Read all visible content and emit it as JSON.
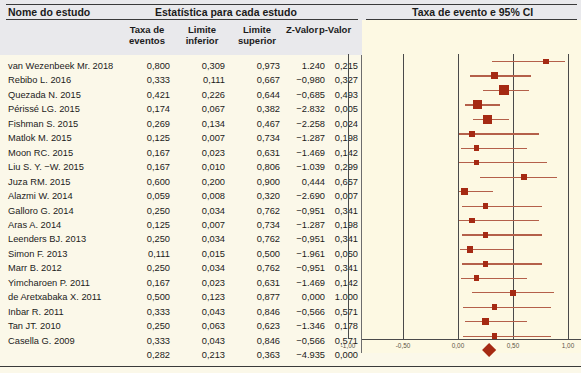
{
  "header": {
    "study_col": "Nome do estudo",
    "stats_group": "Estatística para cada estudo",
    "plot_group": "Taxa de evento e 95% CI",
    "columns": [
      {
        "l1": "Taxa de",
        "l2": "eventos"
      },
      {
        "l1": "Limite",
        "l2": "inferior"
      },
      {
        "l1": "Limite",
        "l2": "superior"
      },
      {
        "l1": "Z-Valor",
        "l2": ""
      },
      {
        "l1": "p-Valor",
        "l2": ""
      }
    ]
  },
  "axis": {
    "ticks": [
      "-1,00",
      "-0,50",
      "0,00",
      "0,50",
      "1,00"
    ],
    "tick_values": [
      -1.0,
      -0.5,
      0.0,
      0.5,
      1.0
    ],
    "min": -1.0,
    "max": 1.0
  },
  "colors": {
    "marker": "#a52a13",
    "ci": "#b4604a",
    "header_band": "#e9e9ec",
    "plot_bg": "#fdf9e3",
    "page_bg": "#fbf8e9"
  },
  "chart_data": {
    "type": "forest",
    "title": "Taxa de evento e 95% CI",
    "xlabel": "",
    "ylabel": "",
    "xlim": [
      -1.0,
      1.0
    ],
    "grid": true,
    "legend": "none",
    "columns": [
      "Nome do estudo",
      "Taxa de eventos",
      "Limite inferior",
      "Limite superior",
      "Z-Valor",
      "p-Valor"
    ],
    "rows": [
      {
        "study": "van Wezenbeek Mr. 2018",
        "rate": "0,800",
        "lower": "0,309",
        "upper": "0,973",
        "z": "1.240",
        "p": "0,215",
        "rate_v": 0.8,
        "lower_v": 0.309,
        "upper_v": 0.973,
        "weight": 0.3
      },
      {
        "study": "Rebibo L. 2016",
        "rate": "0,333",
        "lower": "0,111",
        "upper": "0,667",
        "z": "−0,980",
        "p": "0,327",
        "rate_v": 0.333,
        "lower_v": 0.111,
        "upper_v": 0.667,
        "weight": 0.52
      },
      {
        "study": "Quezada N. 2015",
        "rate": "0,421",
        "lower": "0,226",
        "upper": "0,644",
        "z": "−0,685",
        "p": "0,493",
        "rate_v": 0.421,
        "lower_v": 0.226,
        "upper_v": 0.644,
        "weight": 1.0
      },
      {
        "study": "Périssé LG. 2015",
        "rate": "0,174",
        "lower": "0,067",
        "upper": "0,382",
        "z": "−2.832",
        "p": "0,005",
        "rate_v": 0.174,
        "lower_v": 0.067,
        "upper_v": 0.382,
        "weight": 0.82
      },
      {
        "study": "Fishman S. 2015",
        "rate": "0,269",
        "lower": "0,134",
        "upper": "0,467",
        "z": "−2.258",
        "p": "0,024",
        "rate_v": 0.269,
        "lower_v": 0.134,
        "upper_v": 0.467,
        "weight": 0.86
      },
      {
        "study": "Matlok M. 2015",
        "rate": "0,125",
        "lower": "0,007",
        "upper": "0,734",
        "z": "−1.287",
        "p": "0,198",
        "rate_v": 0.125,
        "lower_v": 0.007,
        "upper_v": 0.734,
        "weight": 0.4
      },
      {
        "study": "Moon RC. 2015",
        "rate": "0,167",
        "lower": "0,023",
        "upper": "0,631",
        "z": "−1.469",
        "p": "0,142",
        "rate_v": 0.167,
        "lower_v": 0.023,
        "upper_v": 0.631,
        "weight": 0.3
      },
      {
        "study": "Liu S. Y. −W. 2015",
        "rate": "0,167",
        "lower": "0,010",
        "upper": "0,806",
        "z": "−1.039",
        "p": "0,299",
        "rate_v": 0.167,
        "lower_v": 0.01,
        "upper_v": 0.806,
        "weight": 0.3
      },
      {
        "study": "Juza RM. 2015",
        "rate": "0,600",
        "lower": "0,200",
        "upper": "0,900",
        "z": "0,444",
        "p": "0,657",
        "rate_v": 0.6,
        "lower_v": 0.2,
        "upper_v": 0.9,
        "weight": 0.34
      },
      {
        "study": "Alazmi W. 2014",
        "rate": "0,059",
        "lower": "0,008",
        "upper": "0,320",
        "z": "−2.690",
        "p": "0,007",
        "rate_v": 0.059,
        "lower_v": 0.008,
        "upper_v": 0.32,
        "weight": 0.4
      },
      {
        "study": "Galloro G. 2014",
        "rate": "0,250",
        "lower": "0,034",
        "upper": "0,762",
        "z": "−0,951",
        "p": "0,341",
        "rate_v": 0.25,
        "lower_v": 0.034,
        "upper_v": 0.762,
        "weight": 0.3
      },
      {
        "study": "Aras A. 2014",
        "rate": "0,125",
        "lower": "0,007",
        "upper": "0,734",
        "z": "−1.287",
        "p": "0,198",
        "rate_v": 0.125,
        "lower_v": 0.007,
        "upper_v": 0.734,
        "weight": 0.3
      },
      {
        "study": "Leenders BJ. 2013",
        "rate": "0,250",
        "lower": "0,034",
        "upper": "0,762",
        "z": "−0,951",
        "p": "0,341",
        "rate_v": 0.25,
        "lower_v": 0.034,
        "upper_v": 0.762,
        "weight": 0.36
      },
      {
        "study": "Simon F. 2013",
        "rate": "0,111",
        "lower": "0,015",
        "upper": "0,500",
        "z": "−1.961",
        "p": "0,050",
        "rate_v": 0.111,
        "lower_v": 0.015,
        "upper_v": 0.5,
        "weight": 0.42
      },
      {
        "study": "Marr B. 2012",
        "rate": "0,250",
        "lower": "0,034",
        "upper": "0,762",
        "z": "−0,951",
        "p": "0,341",
        "rate_v": 0.25,
        "lower_v": 0.034,
        "upper_v": 0.762,
        "weight": 0.36
      },
      {
        "study": "Yimcharoen P. 2011",
        "rate": "0,167",
        "lower": "0,023",
        "upper": "0,631",
        "z": "−1.469",
        "p": "0,142",
        "rate_v": 0.167,
        "lower_v": 0.023,
        "upper_v": 0.631,
        "weight": 0.3
      },
      {
        "study": "de Aretxabaka X. 2011",
        "rate": "0,500",
        "lower": "0,123",
        "upper": "0,877",
        "z": "0,000",
        "p": "1.000",
        "rate_v": 0.5,
        "lower_v": 0.123,
        "upper_v": 0.877,
        "weight": 0.36
      },
      {
        "study": "Inbar R. 2011",
        "rate": "0,333",
        "lower": "0,043",
        "upper": "0,846",
        "z": "−0,566",
        "p": "0,571",
        "rate_v": 0.333,
        "lower_v": 0.043,
        "upper_v": 0.846,
        "weight": 0.3
      },
      {
        "study": "Tan JT. 2010",
        "rate": "0,250",
        "lower": "0,063",
        "upper": "0,623",
        "z": "−1.346",
        "p": "0,178",
        "rate_v": 0.25,
        "lower_v": 0.063,
        "upper_v": 0.623,
        "weight": 0.52
      },
      {
        "study": "Casella G. 2009",
        "rate": "0,333",
        "lower": "0,043",
        "upper": "0,846",
        "z": "−0,566",
        "p": "0,571",
        "rate_v": 0.333,
        "lower_v": 0.043,
        "upper_v": 0.846,
        "weight": 0.3
      }
    ],
    "summary": {
      "study": "",
      "rate": "0,282",
      "lower": "0,213",
      "upper": "0,363",
      "z": "−4.935",
      "p": "0,000",
      "rate_v": 0.282,
      "lower_v": 0.213,
      "upper_v": 0.363
    }
  }
}
